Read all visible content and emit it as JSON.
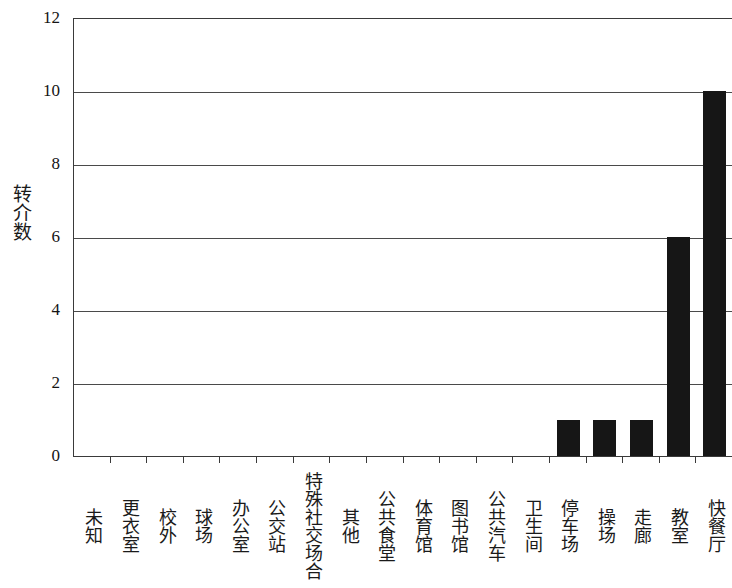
{
  "chart_data": {
    "type": "bar",
    "title": "",
    "subtitle": "",
    "xlabel": "",
    "ylabel": "转介数",
    "ylim": [
      0,
      12
    ],
    "y_ticks": [
      0,
      2,
      4,
      6,
      8,
      10,
      12
    ],
    "y_tick_labels": [
      "0",
      "2",
      "4",
      "6",
      "8",
      "10",
      "12"
    ],
    "grid": true,
    "grid_axis": "y",
    "legend": false,
    "legend_position": "none",
    "bar_color": "#161616",
    "axis_color": "#3a3a3a",
    "background_color": "#ffffff",
    "categories": [
      "未知",
      "更衣室",
      "校外",
      "球场",
      "办公室",
      "公交站",
      "特殊社交场合",
      "其他",
      "公共食堂",
      "体育馆",
      "图书馆",
      "公共汽车",
      "卫生间",
      "停车场",
      "操场",
      "走廊",
      "教室",
      "快餐厅"
    ],
    "values": [
      0,
      0,
      0,
      0,
      0,
      0,
      0,
      0,
      0,
      0,
      0,
      0,
      0,
      1,
      1,
      1,
      6,
      10
    ]
  }
}
